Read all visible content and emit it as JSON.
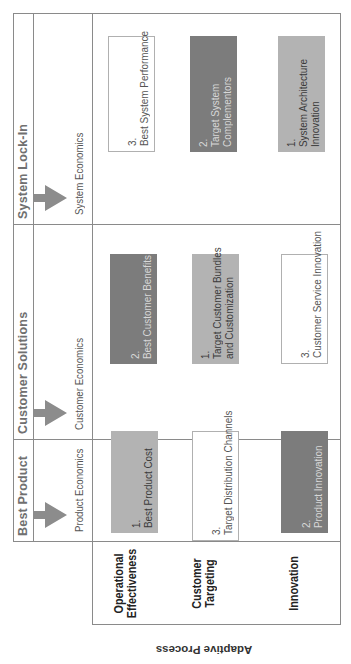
{
  "diagram": {
    "side_label": "Adaptive Process",
    "columns": [
      {
        "title": "Best Product",
        "economics": "Product Economics"
      },
      {
        "title": "Customer Solutions",
        "economics": "Customer Economics"
      },
      {
        "title": "System Lock-In",
        "economics": "System Economics"
      }
    ],
    "rows": [
      {
        "label_line1": "Operational",
        "label_line2": "Effectiveness"
      },
      {
        "label_line1": "Customer",
        "label_line2": "Targeting"
      },
      {
        "label_line1": "Innovation",
        "label_line2": ""
      }
    ],
    "cells": {
      "op_best": {
        "num": "1.",
        "line1": "Best Product Cost",
        "line2": "",
        "shade": "light"
      },
      "op_cust": {
        "num": "2.",
        "line1": "Best Customer Benefits",
        "line2": "",
        "shade": "dark"
      },
      "op_sys": {
        "num": "3.",
        "line1": "Best System Performance",
        "line2": "",
        "shade": "white"
      },
      "ct_best": {
        "num": "3.",
        "line1": "Target Distribution Channels",
        "line2": "",
        "shade": "white"
      },
      "ct_cust": {
        "num": "1.",
        "line1": "Target Customer Bundles",
        "line2": "and Customization",
        "shade": "light"
      },
      "ct_sys": {
        "num": "2.",
        "line1": "Target System",
        "line2": "Complementors",
        "shade": "dark"
      },
      "in_best": {
        "num": "2.",
        "line1": "Product Innovation",
        "line2": "",
        "shade": "dark"
      },
      "in_cust": {
        "num": "3.",
        "line1": "Customer Service Innovation",
        "line2": "",
        "shade": "white"
      },
      "in_sys": {
        "num": "1.",
        "line1": "System Architecture",
        "line2": "Innovation",
        "shade": "light"
      }
    },
    "colors": {
      "grid": "#8a8a8a",
      "light_box": "#b3b3b3",
      "dark_box": "#7c7c7c",
      "arrow": "#8c8c8c"
    }
  }
}
